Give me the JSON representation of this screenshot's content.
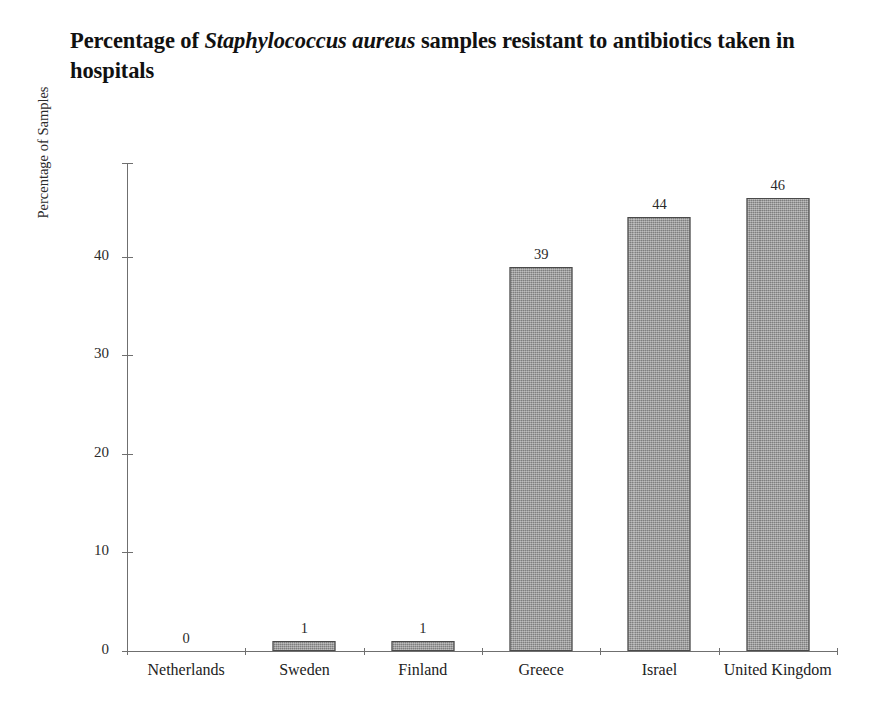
{
  "chart_data": {
    "type": "bar",
    "title": "Percentage of Staphylococcus aureus samples resistant to antibiotics taken in hospitals",
    "title_line1_pre": "Percentage of ",
    "title_line1_italic": "Staphylococcus aureus",
    "title_line1_post": " samples resistant to",
    "title_line2": "antibiotics taken in hospitals",
    "xlabel": "",
    "ylabel": "Percentage of Samples",
    "categories": [
      "Netherlands",
      "Sweden",
      "Finland",
      "Greece",
      "Israel",
      "United Kingdom"
    ],
    "values": [
      0,
      1,
      1,
      39,
      44,
      46
    ],
    "value_labels": [
      "0",
      "1",
      "1",
      "39",
      "44",
      "46"
    ],
    "ylim": [
      0,
      49.5
    ],
    "yticks": [
      0,
      10,
      20,
      30,
      40
    ],
    "ytick_labels": [
      "0",
      "10",
      "20",
      "30",
      "40"
    ],
    "grid": false,
    "legend": false,
    "bar_fill_color": "#8d8d8d",
    "bar_border_color": "#4a4a4a",
    "axis_color": "#6f6f6f",
    "text_color": "#222222"
  }
}
